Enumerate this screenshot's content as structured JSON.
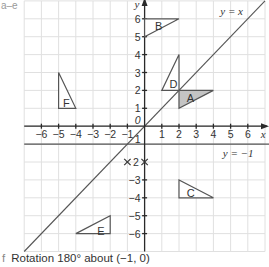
{
  "corner_label": "a–e",
  "caption": {
    "letter": "f",
    "text": "Rotation 180° about (−1, 0)"
  },
  "diagram": {
    "x_axis_label": "x",
    "y_axis_label": "y",
    "x_range": [
      -7,
      7
    ],
    "y_range": [
      -7,
      7
    ],
    "x_ticks": [
      -6,
      -5,
      -4,
      -3,
      -2,
      -1,
      1,
      2,
      3,
      4,
      5,
      6
    ],
    "y_ticks": [
      -6,
      -5,
      -4,
      -3,
      1,
      2,
      3,
      4,
      5,
      6
    ],
    "origin_label": "0",
    "mirror_lines": [
      {
        "label": "y = x",
        "type": "y=x"
      },
      {
        "label": "y = −1",
        "type": "horizontal",
        "y": -1
      }
    ],
    "special_marks": {
      "crosses": [
        [
          -1,
          -2
        ],
        [
          0,
          -2
        ]
      ],
      "label": "2",
      "label_at": [
        -0.5,
        -2
      ]
    },
    "shapes": [
      {
        "name": "A",
        "vertices": [
          [
            2,
            2
          ],
          [
            4,
            2
          ],
          [
            2,
            1
          ]
        ],
        "filled": true,
        "label_at": [
          2.45,
          1.55
        ]
      },
      {
        "name": "B",
        "vertices": [
          [
            0,
            6
          ],
          [
            2,
            6
          ],
          [
            0,
            5
          ]
        ],
        "filled": false,
        "label_at": [
          0.6,
          5.6
        ]
      },
      {
        "name": "C",
        "vertices": [
          [
            2,
            -3
          ],
          [
            2,
            -4
          ],
          [
            4,
            -4
          ]
        ],
        "filled": false,
        "label_at": [
          2.45,
          -3.75
        ]
      },
      {
        "name": "D",
        "vertices": [
          [
            2,
            2
          ],
          [
            1,
            2
          ],
          [
            2,
            4
          ]
        ],
        "filled": false,
        "label_at": [
          1.45,
          2.35
        ]
      },
      {
        "name": "E",
        "vertices": [
          [
            -4,
            -6
          ],
          [
            -2,
            -6
          ],
          [
            -2,
            -5
          ]
        ],
        "filled": false,
        "label_at": [
          -2.75,
          -5.85
        ]
      },
      {
        "name": "F",
        "vertices": [
          [
            -5,
            3
          ],
          [
            -5,
            1
          ],
          [
            -4,
            1
          ]
        ],
        "filled": false,
        "label_at": [
          -4.75,
          1.3
        ]
      }
    ]
  }
}
